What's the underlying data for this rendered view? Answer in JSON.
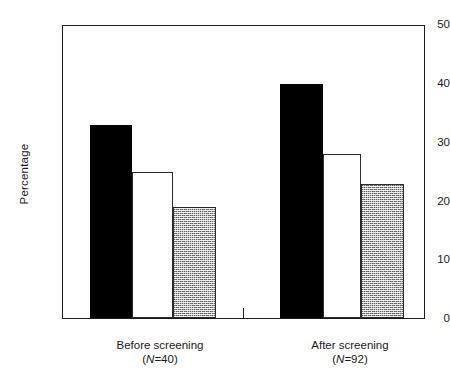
{
  "chart_data": {
    "type": "bar",
    "title": "",
    "subtitle": "",
    "xlabel": "",
    "ylabel": "Percentage",
    "ylim": [
      0,
      50
    ],
    "yticks": [
      0,
      10,
      20,
      30,
      40,
      50
    ],
    "ytick_labels": [
      "0",
      "10",
      "20",
      "30",
      "40",
      "50"
    ],
    "grid": false,
    "legend": null,
    "categories": [
      "Before screening",
      "After screening"
    ],
    "category_annotations": [
      "(N=40)",
      "(N=92)"
    ],
    "category_n_prefix": "N",
    "category_n_values": [
      "40",
      "92"
    ],
    "series": [
      {
        "name": "solid-black-bar",
        "fill": "solid-black",
        "values": [
          33,
          40
        ]
      },
      {
        "name": "open-white-bar",
        "fill": "open-white",
        "values": [
          25,
          28
        ]
      },
      {
        "name": "stippled-gray-bar",
        "fill": "stippled-gray",
        "values": [
          19,
          23
        ]
      }
    ],
    "colors": {
      "solid-black": "#000000",
      "open-white": "#ffffff",
      "stippled-gray": "#a8a8a8",
      "axis": "#1a1a1a",
      "background": "#ffffff"
    }
  },
  "axis": {
    "y_title": "Percentage",
    "tick_labels": [
      "50",
      "40",
      "30",
      "20",
      "10",
      "0"
    ]
  },
  "groups": [
    {
      "label": "Before screening",
      "n_prefix": "N",
      "n_eq": "=40",
      "n_text": "(N=40)",
      "bars": [
        {
          "name": "before-solid-bar",
          "value": 33
        },
        {
          "name": "before-open-bar",
          "value": 25
        },
        {
          "name": "before-stipple-bar",
          "value": 19
        }
      ]
    },
    {
      "label": "After screening",
      "n_prefix": "N",
      "n_eq": "=92",
      "n_text": "(N=92)",
      "bars": [
        {
          "name": "after-solid-bar",
          "value": 40
        },
        {
          "name": "after-open-bar",
          "value": 28
        },
        {
          "name": "after-stipple-bar",
          "value": 23
        }
      ]
    }
  ]
}
